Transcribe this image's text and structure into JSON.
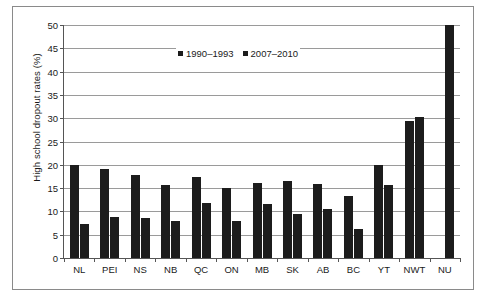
{
  "chart_data": {
    "type": "bar",
    "title": "",
    "xlabel": "",
    "ylabel": "High school dropout rates  (%)",
    "ylim": [
      0,
      50
    ],
    "yticks": [
      0,
      5,
      10,
      15,
      20,
      25,
      30,
      35,
      40,
      45,
      50
    ],
    "ytick_labels": [
      "0",
      "5",
      "10",
      "15",
      "20",
      "25",
      "30",
      "35",
      "40",
      "45",
      "50"
    ],
    "grid": true,
    "legend_position": "top-center-inside",
    "categories": [
      "NL",
      "PEI",
      "NS",
      "NB",
      "QC",
      "ON",
      "MB",
      "SK",
      "AB",
      "BC",
      "YT",
      "NWT",
      "NU"
    ],
    "series": [
      {
        "name": "1990–1993",
        "color": "#1c1c1c",
        "values": [
          20.0,
          19.0,
          17.8,
          15.6,
          17.3,
          15.0,
          16.0,
          16.5,
          15.8,
          13.4,
          20.0,
          29.3,
          null
        ]
      },
      {
        "name": "2007–2010",
        "color": "#1c1c1c",
        "values": [
          7.3,
          8.7,
          8.5,
          8.0,
          11.8,
          8.0,
          11.5,
          9.5,
          10.5,
          6.2,
          15.6,
          30.2,
          50.0
        ]
      }
    ]
  },
  "axis": {
    "y_title": "High school dropout rates  (%)"
  }
}
